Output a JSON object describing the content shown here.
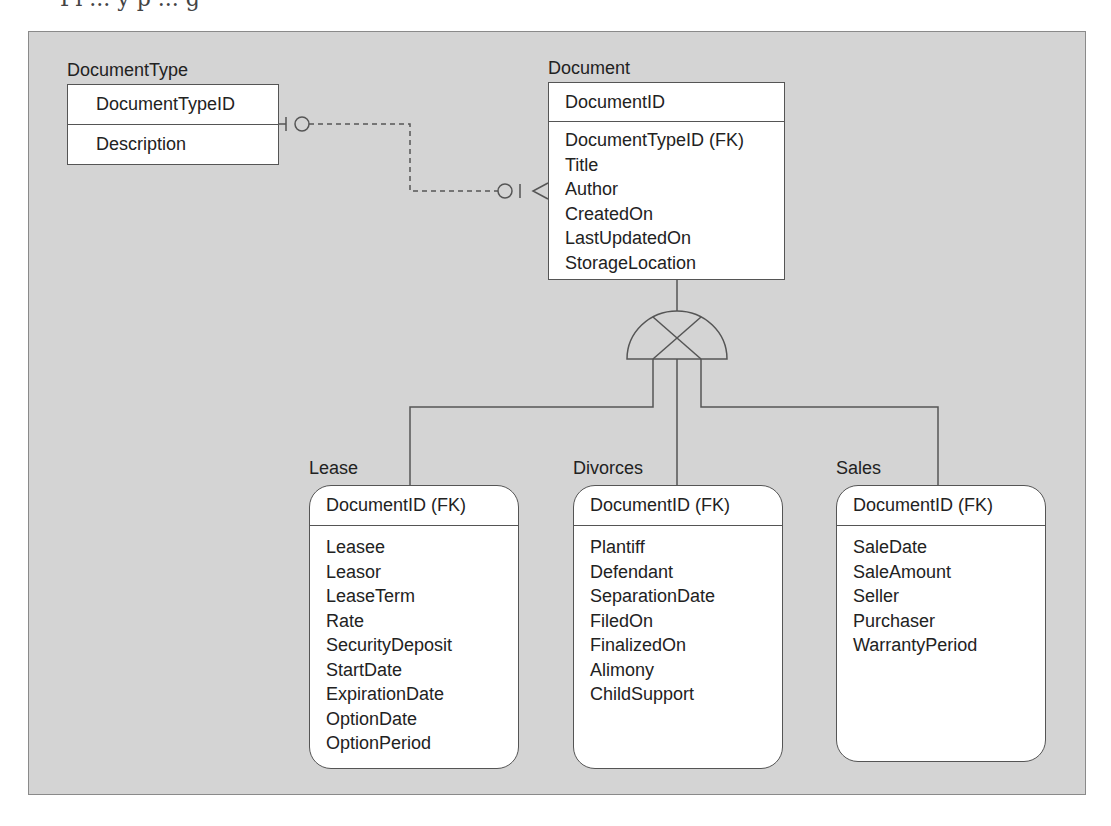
{
  "page": {
    "cut_off_caption": "Fi   ...   y  p    ...  g"
  },
  "entities": {
    "document_type": {
      "name": "DocumentType",
      "key": "DocumentTypeID",
      "attributes": [
        "Description"
      ]
    },
    "document": {
      "name": "Document",
      "key": "DocumentID",
      "attributes": [
        "DocumentTypeID (FK)",
        "Title",
        "Author",
        "CreatedOn",
        "LastUpdatedOn",
        "StorageLocation"
      ]
    },
    "lease": {
      "name": "Lease",
      "key": "DocumentID (FK)",
      "attributes": [
        "Leasee",
        "Leasor",
        "LeaseTerm",
        "Rate",
        "SecurityDeposit",
        "StartDate",
        "ExpirationDate",
        "OptionDate",
        "OptionPeriod"
      ]
    },
    "divorces": {
      "name": "Divorces",
      "key": "DocumentID (FK)",
      "attributes": [
        "Plantiff",
        "Defendant",
        "SeparationDate",
        "FiledOn",
        "FinalizedOn",
        "Alimony",
        "ChildSupport"
      ]
    },
    "sales": {
      "name": "Sales",
      "key": "DocumentID (FK)",
      "attributes": [
        "SaleDate",
        "SaleAmount",
        "Seller",
        "Purchaser",
        "WarrantyPeriod"
      ]
    }
  },
  "relationships": [
    {
      "from": "DocumentType",
      "to": "Document",
      "type": "non-identifying",
      "from_cardinality": "one-and-only-one / zero-or-one",
      "to_cardinality": "zero-or-many"
    },
    {
      "from": "Document",
      "to": [
        "Lease",
        "Divorces",
        "Sales"
      ],
      "type": "exclusive-category"
    }
  ],
  "colors": {
    "frame_background": "#d4d4d4",
    "box_fill": "#ffffff",
    "line": "#555555"
  }
}
